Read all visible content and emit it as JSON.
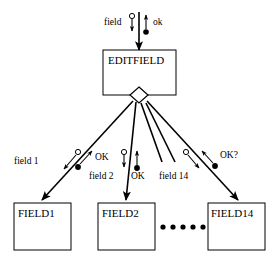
{
  "diagram": {
    "type": "object-interaction-diagram",
    "colors": {
      "stroke": "#000000",
      "fill": "#ffffff",
      "text": "#000000"
    },
    "parent_box": {
      "label": "EDITFIELD",
      "x": 103,
      "y": 50,
      "w": 73,
      "h": 45
    },
    "aggregation_diamond": {
      "name": "aggregation-diamond",
      "cx": 139,
      "cy": 95,
      "rx": 9,
      "ry": 8
    },
    "top_stem": {
      "x": 139,
      "y_top": 12,
      "y_bottom": 50,
      "in_label": "field",
      "out_label": "ok",
      "in_label_x": 104,
      "in_label_y": 25,
      "out_label_x": 151,
      "out_label_y": 25
    },
    "child_boxes": [
      {
        "label": "FIELD1",
        "x": 14,
        "y": 203,
        "w": 57,
        "h": 47
      },
      {
        "label": "FIELD2",
        "x": 98,
        "y": 203,
        "w": 57,
        "h": 47
      },
      {
        "label": "FIELD14",
        "x": 208,
        "y": 203,
        "w": 57,
        "h": 47
      }
    ],
    "ellipsis": {
      "name": "ellipsis-dots",
      "count": 5,
      "cy": 227,
      "x_start": 163,
      "x_step": 10,
      "r": 2.6
    },
    "links": [
      {
        "name": "link-editfield-field1",
        "from_x": 133,
        "from_y": 102,
        "to_x": 42,
        "to_y": 200,
        "labels": [
          {
            "text": "field 1",
            "x": 14,
            "y": 164,
            "dir": "down"
          },
          {
            "text": "OK",
            "x": 82,
            "y": 160,
            "dir": "up"
          }
        ]
      },
      {
        "name": "link-editfield-field2",
        "from_x": 136,
        "from_y": 103,
        "to_x": 126,
        "to_y": 200,
        "labels": [
          {
            "text": "field 2",
            "x": 90,
            "y": 177,
            "dir": "down"
          },
          {
            "text": "OK",
            "x": 129,
            "y": 177,
            "dir": "up"
          }
        ]
      },
      {
        "name": "link-editfield-field-mid-a",
        "from_x": 141,
        "from_y": 103,
        "to_x": 163,
        "to_y": 163
      },
      {
        "name": "link-editfield-field14-label",
        "from_x": 145,
        "from_y": 103,
        "to_x": 175,
        "to_y": 163,
        "labels": [
          {
            "text": "field 14",
            "x": 160,
            "y": 177,
            "dir": "down"
          }
        ]
      },
      {
        "name": "link-editfield-field14",
        "from_x": 147,
        "from_y": 102,
        "to_x": 238,
        "to_y": 200,
        "labels": [
          {
            "text": "OK?",
            "x": 216,
            "y": 161,
            "dir": "up"
          }
        ]
      }
    ]
  }
}
